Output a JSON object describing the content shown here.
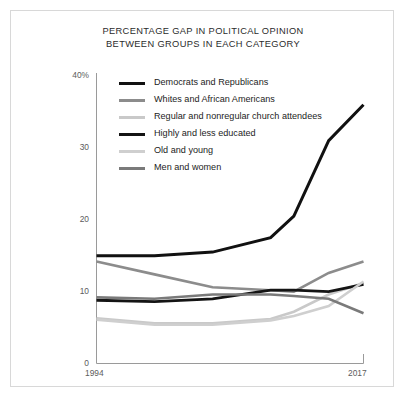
{
  "figure": {
    "title_line1": "PERCENTAGE GAP IN POLITICAL OPINION",
    "title_line2": "BETWEEN GROUPS IN EACH CATEGORY"
  },
  "axes": {
    "y_ticks": [
      "40%",
      "30",
      "20",
      "10",
      "0"
    ],
    "x_ticks": [
      "1994",
      "2017"
    ]
  },
  "legend": {
    "items": [
      {
        "label": "Democrats and Republicans",
        "color": "#111111"
      },
      {
        "label": "Whites and African Americans",
        "color": "#8c8c8c"
      },
      {
        "label": "Regular and nonregular church attendees",
        "color": "#c9c9c9"
      },
      {
        "label": "Highly and less educated",
        "color": "#141414"
      },
      {
        "label": "Old and young",
        "color": "#cfcfcf"
      },
      {
        "label": "Men and women",
        "color": "#7a7a7a"
      }
    ]
  },
  "chart_data": {
    "type": "line",
    "title": "PERCENTAGE GAP IN POLITICAL OPINION BETWEEN GROUPS IN EACH CATEGORY",
    "xlabel": "",
    "ylabel": "",
    "xlim": [
      1994,
      2017
    ],
    "ylim": [
      0,
      40
    ],
    "grid": false,
    "legend_position": "upper-left-inside",
    "y_tick_values": [
      40,
      30,
      20,
      10,
      0
    ],
    "x_tick_values": [
      1994,
      2017
    ],
    "x": [
      1994,
      1999,
      2004,
      2009,
      2011,
      2014,
      2017
    ],
    "series": [
      {
        "name": "Democrats and Republicans",
        "color": "#111111",
        "width": 3.0,
        "values": [
          15,
          15,
          15.5,
          17.5,
          20.5,
          31,
          36
        ]
      },
      {
        "name": "Whites and African Americans",
        "color": "#8c8c8c",
        "width": 2.6,
        "values": [
          14.2,
          12.4,
          10.6,
          10.2,
          10.0,
          12.6,
          14.2
        ]
      },
      {
        "name": "Regular and nonregular church attendees",
        "color": "#c9c9c9",
        "width": 2.6,
        "values": [
          6.3,
          5.6,
          5.6,
          6.2,
          7.2,
          9.6,
          11.2
        ]
      },
      {
        "name": "Highly and less educated",
        "color": "#141414",
        "width": 2.8,
        "values": [
          8.8,
          8.6,
          9.0,
          10.2,
          10.2,
          10.0,
          11.0
        ]
      },
      {
        "name": "Old and young",
        "color": "#cfcfcf",
        "width": 2.6,
        "values": [
          6.1,
          5.4,
          5.4,
          6.0,
          6.6,
          8.0,
          11.4
        ]
      },
      {
        "name": "Men and women",
        "color": "#7a7a7a",
        "width": 2.6,
        "values": [
          9.2,
          9.0,
          9.6,
          9.6,
          9.4,
          9.0,
          7.0
        ]
      }
    ]
  }
}
